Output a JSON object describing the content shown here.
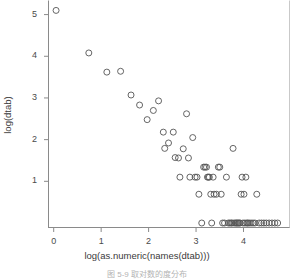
{
  "figure": {
    "caption": "图 5-9  取对数的度分布",
    "background_color": "#ffffff",
    "axis_color": "#8a8a8a",
    "point_color": "#555555"
  },
  "chart_data": {
    "type": "scatter",
    "title": "",
    "subtitle": "",
    "xlabel": "log(as.numeric(names(dtab)))",
    "ylabel": "log(dtab)",
    "xlim": [
      -0.12,
      4.98
    ],
    "ylim": [
      -0.12,
      5.35
    ],
    "xticks": [
      0,
      1,
      2,
      3,
      4
    ],
    "xtick_labels": [
      "0",
      "1",
      "2",
      "3",
      "4"
    ],
    "yticks": [
      1,
      2,
      3,
      4,
      5
    ],
    "ytick_labels": [
      "1",
      "2",
      "3",
      "4",
      "5"
    ],
    "grid": false,
    "legend": null,
    "marker": "open-circle",
    "marker_size": 3,
    "x": [
      0.05,
      0.74,
      1.12,
      1.41,
      1.63,
      1.81,
      1.97,
      2.1,
      2.21,
      2.31,
      2.34,
      2.42,
      2.52,
      2.56,
      2.63,
      2.66,
      2.73,
      2.8,
      2.84,
      2.87,
      2.93,
      2.98,
      3.02,
      3.06,
      3.12,
      3.16,
      3.19,
      3.22,
      3.24,
      3.26,
      3.28,
      3.31,
      3.33,
      3.36,
      3.38,
      3.43,
      3.47,
      3.5,
      3.53,
      3.56,
      3.6,
      3.64,
      3.68,
      3.71,
      3.74,
      3.76,
      3.78,
      3.8,
      3.83,
      3.85,
      3.87,
      3.89,
      3.91,
      3.93,
      3.95,
      3.97,
      3.99,
      4.01,
      4.03,
      4.05,
      4.07,
      4.09,
      4.12,
      4.16,
      4.2,
      4.24,
      4.28,
      4.33,
      4.38,
      4.43,
      4.48,
      4.54,
      4.6,
      4.66,
      4.72
    ],
    "y": [
      5.1,
      4.08,
      3.62,
      3.64,
      3.07,
      2.83,
      2.48,
      2.7,
      2.93,
      2.18,
      1.79,
      1.92,
      2.18,
      1.57,
      1.56,
      1.1,
      1.78,
      2.62,
      1.56,
      1.1,
      2.05,
      1.1,
      1.1,
      0.69,
      0.0,
      1.34,
      1.34,
      1.34,
      1.1,
      1.1,
      1.1,
      0.69,
      0.0,
      1.1,
      0.69,
      0.69,
      1.34,
      1.34,
      0.69,
      0.0,
      0.0,
      1.1,
      0.0,
      0.0,
      0.0,
      0.0,
      1.79,
      0.0,
      0.0,
      0.0,
      0.0,
      0.0,
      0.0,
      0.0,
      0.69,
      1.1,
      0.0,
      0.69,
      0.0,
      1.1,
      0.0,
      0.0,
      0.0,
      0.0,
      0.0,
      0.0,
      0.69,
      0.0,
      0.0,
      0.0,
      0.0,
      0.0,
      0.0,
      0.0,
      0.0
    ]
  }
}
